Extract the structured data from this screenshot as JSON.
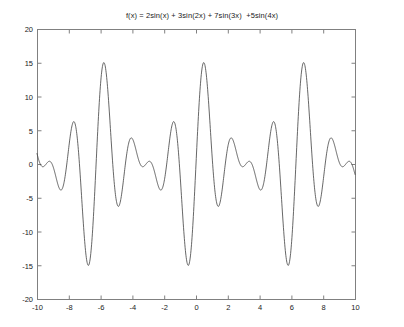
{
  "chart_data": {
    "type": "line",
    "title": "f(x) = 2sin(x) + 3sin(2x) + 7sin(3x)  +5sin(4x)",
    "xlabel": "",
    "ylabel": "",
    "xlim": [
      -10,
      10
    ],
    "ylim": [
      -20,
      20
    ],
    "grid": false,
    "legend": null,
    "xticks": [
      -10,
      -8,
      -6,
      -4,
      -2,
      0,
      2,
      4,
      6,
      8,
      10
    ],
    "xtick_labels": [
      "-10",
      "-8",
      "-6",
      "-4",
      "-2",
      "0",
      "2",
      "4",
      "6",
      "8",
      "10"
    ],
    "yticks": [
      -20,
      -15,
      -10,
      -5,
      0,
      5,
      10,
      15,
      20
    ],
    "ytick_labels": [
      "-20",
      "-15",
      "-10",
      "-5",
      "0",
      "5",
      "10",
      "15",
      "20"
    ],
    "line_color": "#404040",
    "axis_color": "#808080",
    "series": [
      {
        "name": "f(x) = 2sin(x) + 3sin(2x) + 7sin(3x) + 5sin(4x)",
        "expression": "2*sin(x) + 3*sin(2*x) + 7*sin(3*x) + 5*sin(4*x)",
        "terms": [
          {
            "amplitude": 2,
            "frequency": 1
          },
          {
            "amplitude": 3,
            "frequency": 2
          },
          {
            "amplitude": 7,
            "frequency": 3
          },
          {
            "amplitude": 5,
            "frequency": 4
          }
        ],
        "x_start": -10,
        "x_end": 10,
        "samples": 1200,
        "approx_max": 15.2,
        "approx_min": -15.0,
        "period": 6.283
      }
    ]
  },
  "figure": {
    "background_color": "#ffffff",
    "plot_box": {
      "left": 37,
      "top": 29,
      "right": 355,
      "bottom": 299
    }
  }
}
